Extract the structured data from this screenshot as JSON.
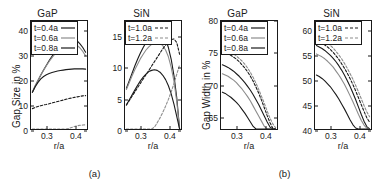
{
  "figure": {
    "subfigures": [
      {
        "caption": "(a)",
        "panels": [
          {
            "title": "GaP",
            "ylabel": "Gap Size in %",
            "xlabel": "r/a",
            "yticks": [
              "0",
              "10",
              "20",
              "30",
              "40"
            ],
            "xticks": [
              "0.3",
              "0.4"
            ],
            "legend": [
              {
                "label": "t=0.4a",
                "style": "solid",
                "color": "#1a1a1a"
              },
              {
                "label": "t=0.6a",
                "style": "solid",
                "color": "#8c8c8c"
              },
              {
                "label": "t=0.8a",
                "style": "solid",
                "color": "#1a1a1a"
              }
            ]
          },
          {
            "title": "SiN",
            "ylabel": "",
            "xlabel": "r/a",
            "yticks": [
              "0",
              "5",
              "10",
              "15"
            ],
            "xticks": [
              "0.3",
              "0.4"
            ],
            "legend": [
              {
                "label": "t=1.0a",
                "style": "dashed",
                "color": "#1a1a1a"
              },
              {
                "label": "t=1.2a",
                "style": "dashed",
                "color": "#8c8c8c"
              }
            ]
          }
        ]
      },
      {
        "caption": "(b)",
        "panels": [
          {
            "title": "GaP",
            "ylabel": "Gap Width in %",
            "xlabel": "r/a",
            "yticks": [
              "65",
              "70",
              "75",
              "80"
            ],
            "xticks": [
              "0.3",
              "0.4"
            ],
            "legend": [
              {
                "label": "t=0.4a",
                "style": "solid",
                "color": "#1a1a1a"
              },
              {
                "label": "t=0.6a",
                "style": "solid",
                "color": "#8c8c8c"
              },
              {
                "label": "t=0.8a",
                "style": "solid",
                "color": "#1a1a1a"
              }
            ]
          },
          {
            "title": "SiN",
            "ylabel": "",
            "xlabel": "r/a",
            "yticks": [
              "40",
              "45",
              "50",
              "55",
              "60"
            ],
            "xticks": [
              "0.3",
              "0.4"
            ],
            "legend": [
              {
                "label": "t=1.0a",
                "style": "dashed",
                "color": "#1a1a1a"
              },
              {
                "label": "t=1.2a",
                "style": "dashed",
                "color": "#8c8c8c"
              }
            ]
          }
        ]
      }
    ]
  },
  "chart_data": [
    {
      "id": "a-gap",
      "type": "line",
      "title": "GaP",
      "xlabel": "r/a",
      "ylabel": "Gap Size in %",
      "xlim": [
        0.245,
        0.445
      ],
      "ylim": [
        0,
        44
      ],
      "xticks": [
        0.3,
        0.4
      ],
      "yticks": [
        0,
        10,
        20,
        30,
        40
      ],
      "grid": false,
      "legend_position": "upper-left",
      "x": [
        0.25,
        0.26,
        0.27,
        0.28,
        0.29,
        0.3,
        0.31,
        0.32,
        0.33,
        0.34,
        0.35,
        0.36,
        0.37,
        0.38,
        0.39,
        0.4,
        0.41,
        0.42,
        0.43,
        0.44
      ],
      "series": [
        {
          "name": "t=0.4a",
          "style": "solid",
          "color": "#1a1a1a",
          "values": [
            15.0,
            17.5,
            19.8,
            22.0,
            24.0,
            26.0,
            27.9,
            29.6,
            31.2,
            32.6,
            33.9,
            35.0,
            35.9,
            36.5,
            36.8,
            36.6,
            35.9,
            34.7,
            33.2,
            31.3
          ]
        },
        {
          "name": "t=0.6a",
          "style": "solid",
          "color": "#8c8c8c",
          "values": [
            15.2,
            17.6,
            19.9,
            22.0,
            24.0,
            25.8,
            27.5,
            29.1,
            30.5,
            31.8,
            33.0,
            33.9,
            34.6,
            35.0,
            35.1,
            34.8,
            34.1,
            33.0,
            31.6,
            29.8
          ]
        },
        {
          "name": "t=0.8a",
          "style": "solid",
          "color": "#1a1a1a",
          "values": [
            15.0,
            17.2,
            19.0,
            20.4,
            21.4,
            22.1,
            22.6,
            23.0,
            23.3,
            23.6,
            23.8,
            24.0,
            24.2,
            24.3,
            24.4,
            24.5,
            24.5,
            24.5,
            24.5,
            24.4
          ]
        },
        {
          "name": "t=1.0a",
          "style": "dashed",
          "color": "#1a1a1a",
          "values": [
            8.3,
            8.8,
            9.2,
            9.5,
            9.8,
            10.0,
            10.3,
            10.6,
            10.9,
            11.2,
            11.5,
            11.8,
            12.1,
            12.4,
            12.6,
            12.9,
            13.1,
            13.3,
            13.5,
            13.6
          ]
        },
        {
          "name": "t=1.2a",
          "style": "dashed",
          "color": "#8c8c8c",
          "values": [
            0.0,
            0.0,
            0.0,
            0.0,
            0.0,
            0.0,
            0.0,
            0.0,
            0.0,
            0.0,
            0.0,
            0.0,
            0.0,
            0.2,
            0.6,
            1.0,
            1.3,
            1.5,
            1.6,
            1.7
          ]
        }
      ]
    },
    {
      "id": "a-sin",
      "type": "line",
      "title": "SiN",
      "xlabel": "r/a",
      "ylabel": "",
      "xlim": [
        0.245,
        0.445
      ],
      "ylim": [
        0,
        17.5
      ],
      "xticks": [
        0.3,
        0.4
      ],
      "yticks": [
        0,
        5,
        10,
        15
      ],
      "grid": false,
      "legend_position": "upper-left",
      "x": [
        0.25,
        0.26,
        0.27,
        0.28,
        0.29,
        0.3,
        0.31,
        0.32,
        0.33,
        0.34,
        0.35,
        0.36,
        0.37,
        0.38,
        0.39,
        0.4,
        0.41,
        0.42,
        0.43,
        0.44
      ],
      "series": [
        {
          "name": "t=0.4a",
          "style": "solid",
          "color": "#1a1a1a",
          "values": [
            6.6,
            7.8,
            9.0,
            10.2,
            11.3,
            12.3,
            13.2,
            14.0,
            14.7,
            15.2,
            15.6,
            15.8,
            15.7,
            15.3,
            14.5,
            13.2,
            11.3,
            8.6,
            5.0,
            0.0
          ]
        },
        {
          "name": "t=0.6a",
          "style": "solid",
          "color": "#8c8c8c",
          "values": [
            6.4,
            7.5,
            8.6,
            9.6,
            10.5,
            11.4,
            12.1,
            12.8,
            13.3,
            13.7,
            13.9,
            14.0,
            13.9,
            13.5,
            12.8,
            11.7,
            10.0,
            7.7,
            4.4,
            0.0
          ]
        },
        {
          "name": "t=0.8a",
          "style": "solid",
          "color": "#1a1a1a",
          "values": [
            3.9,
            4.7,
            5.5,
            6.3,
            7.1,
            7.8,
            8.4,
            8.9,
            9.3,
            9.5,
            9.6,
            9.5,
            9.2,
            8.7,
            8.0,
            7.0,
            5.7,
            4.0,
            2.0,
            0.0
          ]
        },
        {
          "name": "t=1.0a",
          "style": "dashed",
          "color": "#1a1a1a",
          "values": [
            3.9,
            4.6,
            5.3,
            6.0,
            6.7,
            7.4,
            8.1,
            8.8,
            9.5,
            10.2,
            10.9,
            11.6,
            12.3,
            13.0,
            13.6,
            14.1,
            14.5,
            14.6,
            14.0,
            12.1
          ]
        },
        {
          "name": "t=1.2a",
          "style": "dashed",
          "color": "#8c8c8c",
          "values": [
            0.0,
            0.0,
            0.0,
            0.0,
            0.0,
            0.0,
            0.0,
            0.0,
            0.0,
            0.0,
            0.3,
            1.0,
            1.8,
            2.7,
            3.7,
            4.8,
            6.0,
            7.4,
            8.9,
            10.4
          ]
        }
      ]
    },
    {
      "id": "b-gap",
      "type": "line",
      "title": "GaP",
      "xlabel": "r/a",
      "ylabel": "Gap Width in %",
      "xlim": [
        0.245,
        0.445
      ],
      "ylim": [
        63,
        80
      ],
      "xticks": [
        0.3,
        0.4
      ],
      "yticks": [
        65,
        70,
        75,
        80
      ],
      "grid": false,
      "legend_position": "upper-left",
      "x": [
        0.25,
        0.26,
        0.27,
        0.28,
        0.29,
        0.3,
        0.31,
        0.32,
        0.33,
        0.34,
        0.35,
        0.36,
        0.37,
        0.38,
        0.39,
        0.4,
        0.41,
        0.42,
        0.43,
        0.44
      ],
      "series": [
        {
          "name": "t=0.4a",
          "style": "solid",
          "color": "#1a1a1a",
          "values": [
            73.1,
            72.9,
            72.7,
            72.4,
            72.1,
            71.7,
            71.3,
            70.8,
            70.3,
            69.7,
            69.1,
            68.4,
            67.6,
            66.8,
            65.9,
            65.0,
            64.1,
            63.3,
            62.6,
            62.2
          ]
        },
        {
          "name": "t=0.6a",
          "style": "solid",
          "color": "#8c8c8c",
          "values": [
            71.7,
            71.5,
            71.3,
            71.0,
            70.7,
            70.3,
            69.8,
            69.3,
            68.7,
            68.1,
            67.4,
            66.6,
            65.8,
            65.0,
            64.2,
            63.4,
            62.7,
            62.1,
            61.7,
            61.5
          ]
        },
        {
          "name": "t=0.8a",
          "style": "solid",
          "color": "#1a1a1a",
          "values": [
            68.8,
            68.6,
            68.3,
            68.0,
            67.6,
            67.2,
            66.7,
            66.1,
            65.5,
            64.8,
            64.1,
            63.4,
            62.7,
            62.0,
            61.4,
            60.9,
            60.5,
            60.2,
            60.0,
            59.9
          ]
        },
        {
          "name": "t=1.0a",
          "style": "dashed",
          "color": "#1a1a1a",
          "values": [
            75.1,
            75.0,
            74.8,
            74.6,
            74.3,
            74.0,
            73.6,
            73.1,
            72.6,
            72.0,
            71.3,
            70.5,
            69.6,
            68.6,
            67.5,
            66.3,
            65.1,
            64.0,
            63.1,
            62.6
          ]
        },
        {
          "name": "t=1.2a",
          "style": "dashed",
          "color": "#8c8c8c",
          "values": [
            75.5,
            75.4,
            75.3,
            75.1,
            74.8,
            74.5,
            74.1,
            73.7,
            73.2,
            72.6,
            71.9,
            71.1,
            70.2,
            69.2,
            68.1,
            67.0,
            65.8,
            64.7,
            63.8,
            63.2
          ]
        }
      ]
    },
    {
      "id": "b-sin",
      "type": "line",
      "title": "SiN",
      "xlabel": "r/a",
      "ylabel": "",
      "xlim": [
        0.245,
        0.445
      ],
      "ylim": [
        40,
        62
      ],
      "xticks": [
        0.3,
        0.4
      ],
      "yticks": [
        40,
        45,
        50,
        55,
        60
      ],
      "grid": false,
      "legend_position": "upper-left",
      "x": [
        0.25,
        0.26,
        0.27,
        0.28,
        0.29,
        0.3,
        0.31,
        0.32,
        0.33,
        0.34,
        0.35,
        0.36,
        0.37,
        0.38,
        0.39,
        0.4,
        0.41,
        0.42,
        0.43,
        0.44
      ],
      "series": [
        {
          "name": "t=0.4a",
          "style": "solid",
          "color": "#1a1a1a",
          "values": [
            57.0,
            56.7,
            56.4,
            56.0,
            55.5,
            55.0,
            54.4,
            53.7,
            52.9,
            52.0,
            51.0,
            49.9,
            48.7,
            47.4,
            46.0,
            44.5,
            43.0,
            41.6,
            40.5,
            40.0
          ]
        },
        {
          "name": "t=0.6a",
          "style": "solid",
          "color": "#8c8c8c",
          "values": [
            55.3,
            55.0,
            54.7,
            54.3,
            53.8,
            53.2,
            52.6,
            51.8,
            51.0,
            50.1,
            49.1,
            48.0,
            46.8,
            45.6,
            44.3,
            43.0,
            41.8,
            40.8,
            40.2,
            40.0
          ]
        },
        {
          "name": "t=0.8a",
          "style": "solid",
          "color": "#1a1a1a",
          "values": [
            51.0,
            50.7,
            50.3,
            49.8,
            49.2,
            48.6,
            47.8,
            47.0,
            46.1,
            45.1,
            44.1,
            43.0,
            41.9,
            40.9,
            40.2,
            40.0,
            40.0,
            40.0,
            40.0,
            40.0
          ]
        },
        {
          "name": "t=1.0a",
          "style": "dashed",
          "color": "#1a1a1a",
          "values": [
            58.0,
            57.8,
            57.5,
            57.1,
            56.7,
            56.2,
            55.6,
            54.9,
            54.2,
            53.3,
            52.4,
            51.4,
            50.3,
            49.1,
            47.8,
            46.4,
            45.0,
            43.6,
            42.3,
            41.4
          ]
        },
        {
          "name": "t=1.2a",
          "style": "dashed",
          "color": "#8c8c8c",
          "values": [
            58.6,
            58.4,
            58.2,
            57.9,
            57.5,
            57.0,
            56.5,
            55.8,
            55.1,
            54.3,
            53.4,
            52.4,
            51.3,
            50.2,
            48.9,
            47.6,
            46.2,
            44.8,
            43.5,
            42.5
          ]
        }
      ]
    }
  ]
}
